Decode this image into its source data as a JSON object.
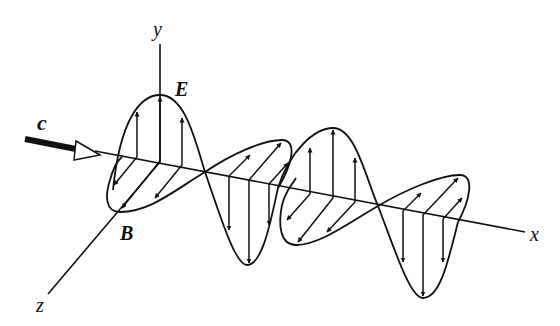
{
  "diagram": {
    "axes": {
      "x_label": "x",
      "y_label": "y",
      "z_label": "z"
    },
    "fields": {
      "electric_label": "E",
      "magnetic_label": "B"
    },
    "propagation": {
      "label": "c",
      "direction": "+x"
    },
    "colors": {
      "ink": "#111111",
      "background": "#ffffff"
    }
  }
}
